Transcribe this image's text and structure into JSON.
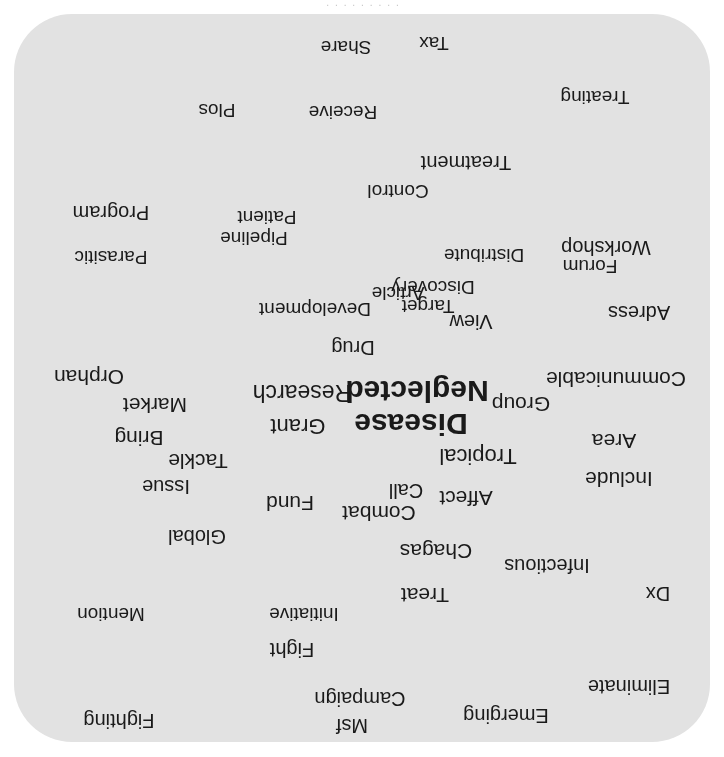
{
  "figure": {
    "kind": "word-cloud",
    "orientation": "upside-down-scan",
    "panel_color": "#e2e2e2",
    "page_color": "#ffffff",
    "text_color": "#1a1a1a",
    "caption_fragment": "· · · · · · · · ·"
  },
  "chart_data": {
    "type": "wordcloud",
    "xlabel": "",
    "ylabel": "",
    "legend": [],
    "grid": false,
    "categories": [
      "Neglected",
      "Disease",
      "Research",
      "Grant",
      "Tropical",
      "Group",
      "Communicable",
      "Area",
      "Include",
      "Affect",
      "Call",
      "Combat",
      "Fund",
      "Market",
      "Bring",
      "Orphan",
      "Tackle",
      "Issue",
      "Global",
      "Chagas",
      "Infectious",
      "Treat",
      "Dx",
      "Eliminate",
      "Emerging",
      "Campaign",
      "Msf",
      "Fighting",
      "Fight",
      "Initiative",
      "Mention",
      "Drug",
      "View",
      "Adress",
      "Target",
      "Discovery",
      "Development",
      "Article",
      "Distribute",
      "Workshop",
      "Forum",
      "Pipeline",
      "Patient",
      "Parasitic",
      "Program",
      "Control",
      "Treatment",
      "Receive",
      "Plos",
      "Treating",
      "Share",
      "Tax"
    ],
    "values": [
      30,
      30,
      23,
      22,
      22,
      21,
      21,
      21,
      21,
      21,
      20,
      21,
      21,
      21,
      21,
      21,
      21,
      20,
      20,
      21,
      20,
      21,
      20,
      20,
      20,
      20,
      20,
      20,
      20,
      19,
      19,
      20,
      20,
      20,
      19,
      19,
      19,
      19,
      19,
      20,
      19,
      19,
      19,
      19,
      20,
      19,
      20,
      19,
      19,
      19,
      19,
      19
    ],
    "words": [
      {
        "text": "Fighting",
        "x": 605,
        "y": 35,
        "size": 20,
        "bold": false
      },
      {
        "text": "Msf",
        "x": 372,
        "y": 30,
        "size": 20,
        "bold": false
      },
      {
        "text": "Emerging",
        "x": 218,
        "y": 40,
        "size": 20,
        "bold": false
      },
      {
        "text": "Campaign",
        "x": 364,
        "y": 57,
        "size": 20,
        "bold": false
      },
      {
        "text": "Eliminate",
        "x": 95,
        "y": 69,
        "size": 20,
        "bold": false
      },
      {
        "text": "Fight",
        "x": 432,
        "y": 106,
        "size": 20,
        "bold": false
      },
      {
        "text": "Mention",
        "x": 613,
        "y": 142,
        "size": 19,
        "bold": false
      },
      {
        "text": "Initiative",
        "x": 420,
        "y": 142,
        "size": 19,
        "bold": false
      },
      {
        "text": "Dx",
        "x": 66,
        "y": 162,
        "size": 20,
        "bold": false
      },
      {
        "text": "Treat",
        "x": 299,
        "y": 161,
        "size": 21,
        "bold": false
      },
      {
        "text": "Infectious",
        "x": 177,
        "y": 190,
        "size": 20,
        "bold": false
      },
      {
        "text": "Chagas",
        "x": 288,
        "y": 205,
        "size": 21,
        "bold": false
      },
      {
        "text": "Global",
        "x": 527,
        "y": 219,
        "size": 20,
        "bold": false
      },
      {
        "text": "Affect",
        "x": 258,
        "y": 258,
        "size": 21,
        "bold": false
      },
      {
        "text": "Combat",
        "x": 345,
        "y": 243,
        "size": 21,
        "bold": false
      },
      {
        "text": "Fund",
        "x": 434,
        "y": 253,
        "size": 21,
        "bold": false
      },
      {
        "text": "Call",
        "x": 318,
        "y": 265,
        "size": 20,
        "bold": false
      },
      {
        "text": "Include",
        "x": 105,
        "y": 277,
        "size": 21,
        "bold": false
      },
      {
        "text": "Issue",
        "x": 558,
        "y": 269,
        "size": 20,
        "bold": false
      },
      {
        "text": "Tropical",
        "x": 246,
        "y": 300,
        "size": 22,
        "bold": false
      },
      {
        "text": "Tackle",
        "x": 526,
        "y": 295,
        "size": 21,
        "bold": false
      },
      {
        "text": "Area",
        "x": 110,
        "y": 315,
        "size": 21,
        "bold": false
      },
      {
        "text": "Bring",
        "x": 585,
        "y": 318,
        "size": 21,
        "bold": false
      },
      {
        "text": "Disease",
        "x": 313,
        "y": 332,
        "size": 30,
        "bold": true
      },
      {
        "text": "Grant",
        "x": 426,
        "y": 330,
        "size": 22,
        "bold": false
      },
      {
        "text": "Group",
        "x": 203,
        "y": 352,
        "size": 21,
        "bold": false
      },
      {
        "text": "Market",
        "x": 569,
        "y": 351,
        "size": 21,
        "bold": false
      },
      {
        "text": "Neglected",
        "x": 307,
        "y": 365,
        "size": 30,
        "bold": true
      },
      {
        "text": "Research",
        "x": 422,
        "y": 364,
        "size": 23,
        "bold": false
      },
      {
        "text": "Communicable",
        "x": 108,
        "y": 377,
        "size": 21,
        "bold": false
      },
      {
        "text": "Orphan",
        "x": 635,
        "y": 379,
        "size": 21,
        "bold": false
      },
      {
        "text": "Drug",
        "x": 371,
        "y": 408,
        "size": 20,
        "bold": false
      },
      {
        "text": "View",
        "x": 253,
        "y": 434,
        "size": 20,
        "bold": false
      },
      {
        "text": "Adress",
        "x": 85,
        "y": 443,
        "size": 20,
        "bold": false
      },
      {
        "text": "Development",
        "x": 409,
        "y": 447,
        "size": 19,
        "bold": false
      },
      {
        "text": "Target",
        "x": 296,
        "y": 450,
        "size": 19,
        "bold": false
      },
      {
        "text": "Article",
        "x": 326,
        "y": 463,
        "size": 19,
        "bold": false
      },
      {
        "text": "Discovery",
        "x": 291,
        "y": 469,
        "size": 19,
        "bold": false
      },
      {
        "text": "Forum",
        "x": 134,
        "y": 490,
        "size": 19,
        "bold": false
      },
      {
        "text": "Distribute",
        "x": 240,
        "y": 501,
        "size": 19,
        "bold": false
      },
      {
        "text": "Parasitic",
        "x": 613,
        "y": 499,
        "size": 19,
        "bold": false
      },
      {
        "text": "Workshop",
        "x": 118,
        "y": 508,
        "size": 20,
        "bold": false
      },
      {
        "text": "Pipeline",
        "x": 470,
        "y": 518,
        "size": 19,
        "bold": false
      },
      {
        "text": "Patient",
        "x": 457,
        "y": 539,
        "size": 19,
        "bold": false
      },
      {
        "text": "Program",
        "x": 613,
        "y": 543,
        "size": 20,
        "bold": false
      },
      {
        "text": "Control",
        "x": 326,
        "y": 565,
        "size": 19,
        "bold": false
      },
      {
        "text": "Treatment",
        "x": 258,
        "y": 593,
        "size": 20,
        "bold": false
      },
      {
        "text": "Receive",
        "x": 381,
        "y": 644,
        "size": 19,
        "bold": false
      },
      {
        "text": "Plos",
        "x": 507,
        "y": 646,
        "size": 19,
        "bold": false
      },
      {
        "text": "Treating",
        "x": 129,
        "y": 659,
        "size": 19,
        "bold": false
      },
      {
        "text": "Share",
        "x": 378,
        "y": 709,
        "size": 19,
        "bold": false
      },
      {
        "text": "Tax",
        "x": 290,
        "y": 713,
        "size": 19,
        "bold": false
      }
    ]
  }
}
